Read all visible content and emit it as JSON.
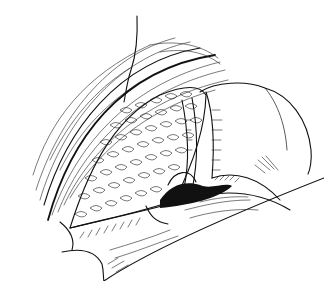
{
  "illustration": {
    "subject": "surgical-field-line-drawing",
    "style": "black ink line art on white",
    "colors": {
      "background": "#ffffff",
      "ink": "#111111"
    },
    "regions": [
      {
        "name": "incision-line",
        "description": "vertical thin line crossing top of drawing"
      },
      {
        "name": "abdominal-wall-upper",
        "description": "curved hatched tissue band upper left"
      },
      {
        "name": "exposed-organ",
        "description": "lobulated scaly-textured organ in center"
      },
      {
        "name": "retracted-bowel",
        "description": "rounded retracted tissue on right"
      },
      {
        "name": "vessel-structure",
        "description": "tubular structure between organ and bowel"
      },
      {
        "name": "abdominal-wall-lower",
        "description": "hatched flap along bottom"
      }
    ]
  }
}
